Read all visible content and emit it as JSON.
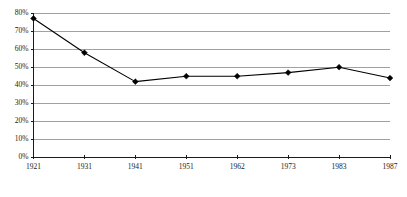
{
  "chart_data": {
    "type": "line",
    "title": "",
    "subtitle": "",
    "xlabel": "",
    "ylabel": "",
    "categories": [
      "1921",
      "1931",
      "1941",
      "1951",
      "1962",
      "1973",
      "1983",
      "1987"
    ],
    "values": [
      77,
      58,
      42,
      45,
      45,
      47,
      50,
      44
    ],
    "series": [
      {
        "name": "",
        "values": [
          77,
          58,
          42,
          45,
          45,
          47,
          50,
          44
        ]
      }
    ],
    "ylim": [
      0,
      80
    ],
    "ytick_values": [
      0,
      10,
      20,
      30,
      40,
      50,
      60,
      70,
      80
    ],
    "ytick_labels": [
      "0%",
      "10%",
      "20%",
      "30%",
      "40%",
      "50%",
      "60%",
      "70%",
      "80%"
    ],
    "xtick_labels": [
      "1921",
      "1931",
      "1941",
      "1951",
      "1962",
      "1973",
      "1983",
      "1987"
    ],
    "grid": true,
    "grid_axis": "y",
    "legend": false,
    "legend_position": "none",
    "marker": "diamond",
    "annotations": []
  },
  "colors": {
    "line": "#000000",
    "marker": "#000000",
    "gridline": "#8a8a8a",
    "axis": "#1a1a1a",
    "background": "#ffffff",
    "tick_text": "#1a1a1a"
  }
}
